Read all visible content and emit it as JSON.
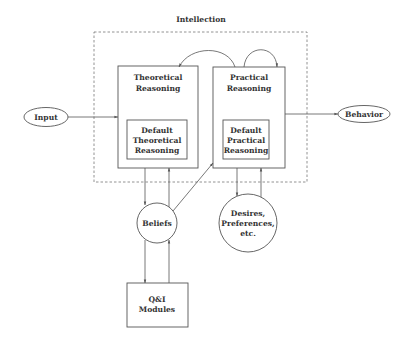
{
  "diagram": {
    "container_label": "Intellection",
    "nodes": {
      "input": {
        "label": "Input",
        "shape": "ellipse"
      },
      "behavior": {
        "label": "Behavior",
        "shape": "ellipse"
      },
      "theoretical": {
        "line1": "Theoretical",
        "line2": "Reasoning",
        "shape": "box"
      },
      "practical": {
        "line1": "Practical",
        "line2": "Reasoning",
        "shape": "box"
      },
      "default_theoretical": {
        "line1": "Default",
        "line2": "Theoretical",
        "line3": "Reasoning",
        "shape": "box"
      },
      "default_practical": {
        "line1": "Default",
        "line2": "Practical",
        "line3": "Reasoning",
        "shape": "box"
      },
      "beliefs": {
        "label": "Beliefs",
        "shape": "circle"
      },
      "desires": {
        "line1": "Desires,",
        "line2": "Preferences,",
        "line3": "etc.",
        "shape": "circle"
      },
      "qi_modules": {
        "line1": "Q&I",
        "line2": "Modules",
        "shape": "box"
      }
    },
    "edges": [
      {
        "from": "Input",
        "to": "Theoretical Reasoning"
      },
      {
        "from": "Practical Reasoning",
        "to": "Behavior"
      },
      {
        "from": "Practical Reasoning",
        "to": "Theoretical Reasoning"
      },
      {
        "from": "Practical Reasoning",
        "to": "Practical Reasoning"
      },
      {
        "from": "Theoretical Reasoning",
        "to": "Beliefs"
      },
      {
        "from": "Beliefs",
        "to": "Theoretical Reasoning"
      },
      {
        "from": "Beliefs",
        "to": "Practical Reasoning"
      },
      {
        "from": "Practical Reasoning",
        "to": "Desires, Preferences, etc."
      },
      {
        "from": "Desires, Preferences, etc.",
        "to": "Practical Reasoning"
      },
      {
        "from": "Beliefs",
        "to": "Q&I Modules"
      },
      {
        "from": "Q&I Modules",
        "to": "Beliefs"
      }
    ]
  }
}
